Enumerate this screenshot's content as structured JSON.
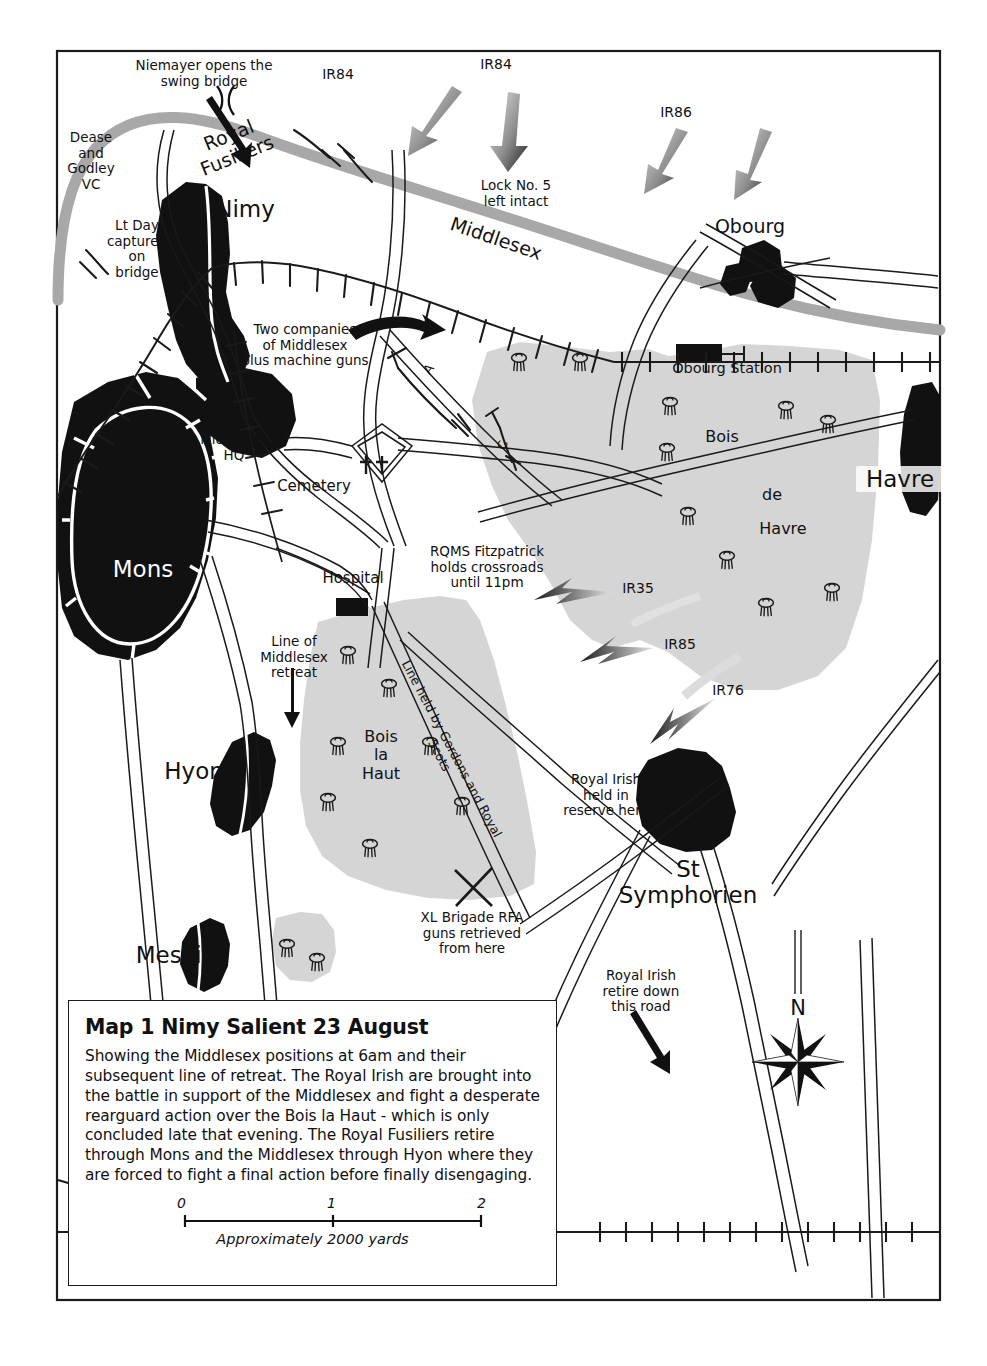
{
  "map": {
    "title": "Map 1 Nimy Salient 23 August",
    "description": "Showing the Middlesex positions at 6am and their subsequent line of retreat. The Royal Irish are brought into the battle in support of the Middlesex and fight a desperate rearguard action over the Bois la Haut - which is only concluded late that evening. The Royal Fusiliers retire through Mons and the Middlesex through Hyon where they are forced to fight a final action before finally disengaging.",
    "compass_label": "N"
  },
  "scale": {
    "ticks": [
      "0",
      "1",
      "2"
    ],
    "caption": "Approximately 2000 yards"
  },
  "places": {
    "nimy": "Nimy",
    "mons": "Mons",
    "hyon": "Hyon",
    "mesvin": "Mesvin",
    "obourg": "Obourg",
    "obourg_station": "Obourg Station",
    "havre": "Havre",
    "st_symphorien": "St\nSymphorien",
    "cemetery": "Cemetery",
    "hospital": "Hospital"
  },
  "woods": {
    "bois": "Bois",
    "de": "de",
    "havre": "Havre",
    "bois_la_haut": "Bois\nla\nHaut"
  },
  "annotations": {
    "niemayer": "Niemayer opens the\nswing bridge",
    "dease_godley": "Dease\nand\nGodley\nVC",
    "lt_day": "Lt Day\ncaptured\non\nbridge",
    "two_companies": "Two companies\nof Middlesex\nplus machine guns",
    "middlesex_hq": "Middlesex\nHQ",
    "lock_no5": "Lock No. 5\nleft intact",
    "rqms": "RQMS Fitzpatrick\nholds crossroads\nuntil 11pm",
    "line_of_retreat": "Line of\nMiddlesex\nretreat",
    "line_held": "Line held by Gordons and Royal Scots",
    "royal_irish_reserve": "Royal Irish\nheld in\nreserve here",
    "royal_irish_retire": "Royal Irish\nretire down\nthis road",
    "xl_brigade": "XL Brigade RFA\nguns retrieved\nfrom here"
  },
  "units": {
    "royal_fusiliers": "Royal Fusiliers",
    "middlesex_river": "Middlesex",
    "company_a": "A",
    "company_c": "C"
  },
  "german_units": {
    "ir84_left": "IR84",
    "ir84_right": "IR84",
    "ir86": "IR86",
    "ir35": "IR35",
    "ir85": "IR85",
    "ir76": "IR76"
  },
  "colors": {
    "built_up": "#111111",
    "canal": "#a8a8a8",
    "wood_fill": "#d5d5d5",
    "road_line": "#1a1a1a",
    "frame": "#1a1a1a",
    "arrow_dark": "#2b2b2b",
    "arrow_light": "#cfcfcf"
  }
}
